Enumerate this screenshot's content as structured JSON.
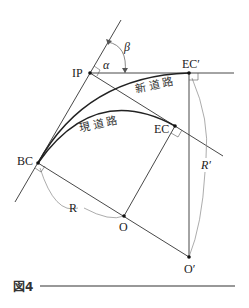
{
  "figure": {
    "caption": "図4",
    "labels": {
      "ip": "IP",
      "ec_prime": "EC′",
      "ec": "EC",
      "bc": "BC",
      "o": "O",
      "o_prime": "O′",
      "r": "R",
      "r_prime": "R′",
      "alpha": "α",
      "beta": "β",
      "new_road": "新道路",
      "current_road": "現道路"
    },
    "points": {
      "IP": [
        90,
        73
      ],
      "EC_prime": [
        189,
        73
      ],
      "EC": [
        175,
        126
      ],
      "BC": [
        38,
        163
      ],
      "O": [
        124,
        216
      ],
      "O_prime": [
        189,
        257
      ]
    },
    "colors": {
      "line": "#333333",
      "thin_line": "#666666",
      "curve": "#222222"
    }
  }
}
